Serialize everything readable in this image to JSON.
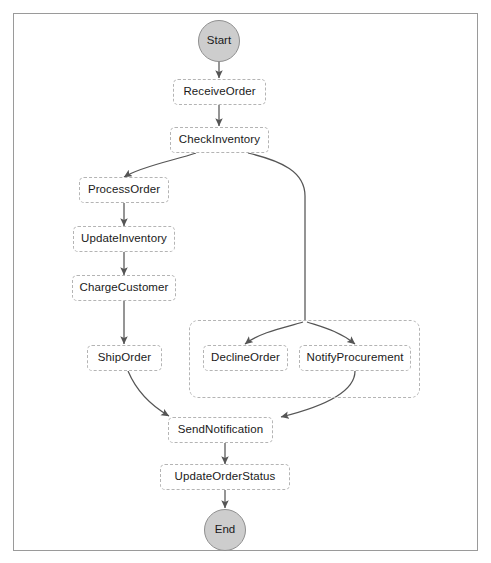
{
  "diagram": {
    "colors": {
      "terminal_fill": "#cdcdcd",
      "terminal_stroke": "#8f8f8f",
      "node_fill": "#ffffff",
      "node_stroke": "#b4b4b4",
      "edge_stroke": "#555555",
      "text": "#1a1a1a",
      "frame_stroke": "#9a9a9a",
      "background": "#ffffff"
    },
    "nodes": {
      "start": {
        "label": "Start",
        "shape": "circle"
      },
      "receive_order": {
        "label": "ReceiveOrder",
        "shape": "rounded-rect"
      },
      "check_inventory": {
        "label": "CheckInventory",
        "shape": "rounded-rect"
      },
      "process_order": {
        "label": "ProcessOrder",
        "shape": "rounded-rect"
      },
      "update_inventory": {
        "label": "UpdateInventory",
        "shape": "rounded-rect"
      },
      "charge_customer": {
        "label": "ChargeCustomer",
        "shape": "rounded-rect"
      },
      "ship_order": {
        "label": "ShipOrder",
        "shape": "rounded-rect"
      },
      "decline_order": {
        "label": "DeclineOrder",
        "shape": "rounded-rect"
      },
      "notify_procurement": {
        "label": "NotifyProcurement",
        "shape": "rounded-rect"
      },
      "send_notification": {
        "label": "SendNotification",
        "shape": "rounded-rect"
      },
      "update_order_status": {
        "label": "UpdateOrderStatus",
        "shape": "rounded-rect"
      },
      "end": {
        "label": "End",
        "shape": "circle"
      }
    },
    "cluster": {
      "label": "",
      "members": [
        "DeclineOrder",
        "NotifyProcurement"
      ]
    },
    "edges": [
      {
        "from": "Start",
        "to": "ReceiveOrder",
        "label": ""
      },
      {
        "from": "ReceiveOrder",
        "to": "CheckInventory",
        "label": ""
      },
      {
        "from": "CheckInventory",
        "to": "ProcessOrder",
        "label": ""
      },
      {
        "from": "CheckInventory",
        "to": "DeclineOrder",
        "label": ""
      },
      {
        "from": "CheckInventory",
        "to": "NotifyProcurement",
        "label": ""
      },
      {
        "from": "ProcessOrder",
        "to": "UpdateInventory",
        "label": ""
      },
      {
        "from": "UpdateInventory",
        "to": "ChargeCustomer",
        "label": ""
      },
      {
        "from": "ChargeCustomer",
        "to": "ShipOrder",
        "label": ""
      },
      {
        "from": "ShipOrder",
        "to": "SendNotification",
        "label": ""
      },
      {
        "from": "NotifyProcurement",
        "to": "SendNotification",
        "label": ""
      },
      {
        "from": "SendNotification",
        "to": "UpdateOrderStatus",
        "label": ""
      },
      {
        "from": "UpdateOrderStatus",
        "to": "End",
        "label": ""
      }
    ]
  }
}
